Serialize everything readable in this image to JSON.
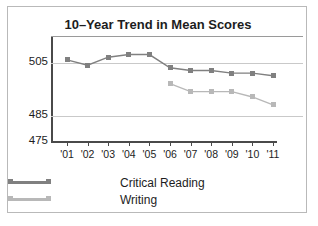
{
  "chart_data": {
    "type": "line",
    "title": "10–Year Trend in Mean Scores",
    "xlabel": "",
    "ylabel": "",
    "categories": [
      "'01",
      "'02",
      "'03",
      "'04",
      "'05",
      "'06",
      "'07",
      "'08",
      "'09",
      "'10",
      "'11"
    ],
    "ylim": [
      475,
      515
    ],
    "yticks": [
      475,
      485,
      505
    ],
    "ytick_labels": [
      "475",
      "485",
      "505"
    ],
    "grid": true,
    "legend_position": "bottom",
    "series": [
      {
        "name": "Critical Reading",
        "color": "#808080",
        "x": [
          "'01",
          "'02",
          "'03",
          "'04",
          "'05",
          "'06",
          "'07",
          "'08",
          "'09",
          "'10",
          "'11"
        ],
        "values": [
          506,
          504,
          507,
          508,
          508,
          503,
          502,
          502,
          501,
          501,
          500
        ]
      },
      {
        "name": "Writing",
        "color": "#b8b8b8",
        "x": [
          "'06",
          "'07",
          "'08",
          "'09",
          "'10",
          "'11"
        ],
        "values": [
          497,
          494,
          494,
          494,
          492,
          489
        ]
      }
    ]
  },
  "legend": {
    "entries": [
      {
        "label": "Critical Reading",
        "color": "#808080"
      },
      {
        "label": "Writing",
        "color": "#b8b8b8"
      }
    ]
  }
}
